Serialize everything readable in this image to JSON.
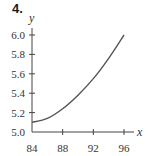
{
  "problem_number": "4.",
  "chart_data": {
    "type": "line",
    "title": "",
    "xlabel": "x",
    "ylabel": "y",
    "x": [
      84,
      86,
      88,
      90,
      92,
      94,
      96
    ],
    "series": [
      {
        "name": "y",
        "values": [
          5.1,
          5.14,
          5.24,
          5.38,
          5.55,
          5.76,
          6.0
        ]
      }
    ],
    "xticks": [
      "84",
      "88",
      "92",
      "96"
    ],
    "yticks": [
      "5.0",
      "5.2",
      "5.4",
      "5.6",
      "5.8",
      "6.0"
    ],
    "xlim": [
      84,
      96
    ],
    "ylim": [
      5.0,
      6.0
    ],
    "grid": false,
    "legend": "none",
    "colors": {
      "curve": "#555555",
      "axis": "#444444"
    }
  }
}
